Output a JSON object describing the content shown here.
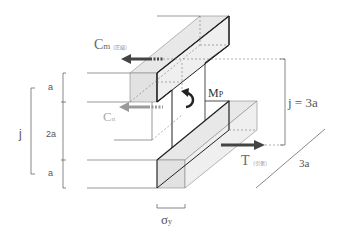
{
  "labels": {
    "cm_main": "C",
    "cm_sub": "m",
    "cm_note": "（圧縮）",
    "cn_main": "C",
    "cn_sub": "n",
    "mp_main": "M",
    "mp_sub": "P",
    "t_main": "T",
    "t_note": "（引張）",
    "j_eq": "j = 3a",
    "depth": "3a",
    "sigma": "σ",
    "sigma_sub": "y",
    "dim_j": "j",
    "dim_a_top": "a",
    "dim_2a": "2a",
    "dim_a_bottom": "a"
  },
  "colors": {
    "line": "#2a2a2a",
    "thin_line": "#555555",
    "dashed": "#777777",
    "face_light": "#e6e6e6",
    "face_mid": "#d9d9d9",
    "arrow_dark": "#444444",
    "arrow_light": "#9a9a9a",
    "text": "#444444",
    "text_light": "#aaaaaa"
  }
}
